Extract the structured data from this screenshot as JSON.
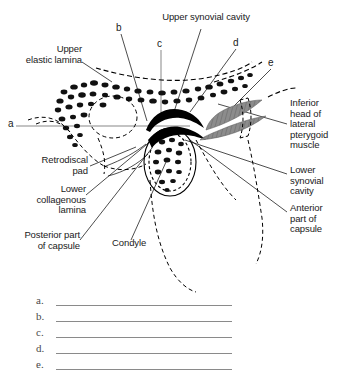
{
  "figure": {
    "title_cropped": "",
    "background_color": "#ffffff",
    "ink_color": "#000000",
    "muscle_color": "#8c8c8c"
  },
  "labels": {
    "upper_synovial_cavity": "Upper synovial cavity",
    "upper_elastic_lamina": "Upper\nelastic lamina",
    "retrodiscal_pad": "Retrodiscal\npad",
    "lower_collagenous_lamina": "Lower\ncollagenous\nlamina",
    "posterior_part_of_capsule": "Posterior part\nof capsule",
    "condyle": "Condyle",
    "inferior_head": "Inferior\nhead of\nlateral\npterygoid\nmuscle",
    "lower_synovial_cavity": "Lower\nsynovial\ncavity",
    "anterior_part_of_capsule": "Anterior\npart of\ncapsule"
  },
  "markers": {
    "a": "a",
    "b": "b",
    "c": "c",
    "d": "d",
    "e": "e"
  },
  "answer_blanks": [
    {
      "letter": "a."
    },
    {
      "letter": "b."
    },
    {
      "letter": "c."
    },
    {
      "letter": "d."
    },
    {
      "letter": "e."
    }
  ]
}
